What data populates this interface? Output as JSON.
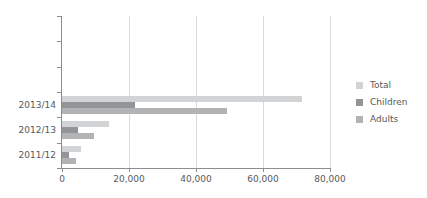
{
  "chart_data": {
    "type": "bar",
    "orientation": "horizontal",
    "title": "",
    "xlabel": "",
    "ylabel": "",
    "categories": [
      "2013/14",
      "2012/13",
      "2011/12"
    ],
    "series": [
      {
        "name": "Total",
        "color": "#d2d3d4",
        "values": [
          71600,
          14000,
          5700
        ]
      },
      {
        "name": "Children",
        "color": "#929497",
        "values": [
          21800,
          4800,
          2100
        ]
      },
      {
        "name": "Adults",
        "color": "#b1b3b5",
        "values": [
          49300,
          9500,
          4200
        ]
      }
    ],
    "xlim": [
      0,
      80000
    ],
    "xticks": [
      0,
      20000,
      40000,
      60000,
      80000
    ],
    "xtick_labels": [
      "0",
      "20,000",
      "40,000",
      "60,000",
      "80,000"
    ],
    "grid": "vertical",
    "legend_position": "right",
    "background_color": "#ffffff",
    "axis_color": "#8c8d8f",
    "grid_color": "#d9dadb",
    "text_color": "#58595b"
  },
  "legend": {
    "items": [
      {
        "label": "Total"
      },
      {
        "label": "Children"
      },
      {
        "label": "Adults"
      }
    ]
  }
}
